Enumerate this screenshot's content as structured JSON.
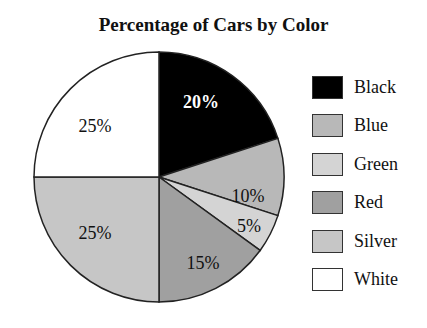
{
  "chart_data": {
    "type": "pie",
    "title": "Percentage of Cars by Color",
    "categories": [
      "Black",
      "Blue",
      "Green",
      "Red",
      "Silver",
      "White"
    ],
    "values": [
      20,
      10,
      5,
      15,
      25,
      25
    ],
    "labels": [
      "20%",
      "10%",
      "5%",
      "15%",
      "25%",
      "25%"
    ],
    "colors": [
      "#000000",
      "#b8b8b8",
      "#d4d4d4",
      "#a0a0a0",
      "#c6c6c6",
      "#ffffff"
    ],
    "legend_position": "right",
    "start_angle": "12 o'clock, clockwise"
  },
  "legend": {
    "items": [
      {
        "label": "Black",
        "color": "#000000"
      },
      {
        "label": "Blue",
        "color": "#b8b8b8"
      },
      {
        "label": "Green",
        "color": "#d4d4d4"
      },
      {
        "label": "Red",
        "color": "#a0a0a0"
      },
      {
        "label": "Silver",
        "color": "#c6c6c6"
      },
      {
        "label": "White",
        "color": "#ffffff"
      }
    ]
  }
}
